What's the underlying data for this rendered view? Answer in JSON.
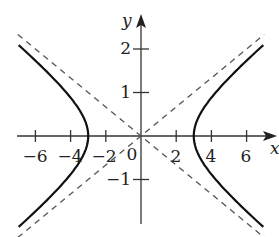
{
  "chart_data": {
    "type": "line",
    "title": "",
    "xlabel": "x",
    "ylabel": "y",
    "xlim": [
      -7.2,
      7.6
    ],
    "ylim": [
      -2.0,
      2.75
    ],
    "grid": false,
    "x_ticks": [
      -6,
      -4,
      -2,
      0,
      2,
      4,
      6
    ],
    "x_tick_labels": [
      "−6",
      "−4",
      "−2",
      "0",
      "2",
      "4",
      "6"
    ],
    "y_ticks": [
      2,
      1,
      -1
    ],
    "y_tick_labels": [
      "2",
      "1",
      "−1"
    ],
    "series": [
      {
        "name": "hyperbola",
        "equation": "x^2/9 - y^2 = 1",
        "style": "solid",
        "vertices": [
          [
            -3,
            0
          ],
          [
            3,
            0
          ]
        ],
        "x_range": [
          -6.9,
          6.9
        ]
      },
      {
        "name": "asymptote",
        "equation": "y = x/3",
        "style": "dashed",
        "x_range": [
          -6.9,
          6.9
        ]
      },
      {
        "name": "asymptote",
        "equation": "y = -x/3",
        "style": "dashed",
        "x_range": [
          -6.9,
          6.9
        ]
      }
    ]
  },
  "labels": {
    "x_axis": "x",
    "y_axis": "y",
    "origin": "0",
    "xt": [
      "−6",
      "−4",
      "−2",
      "2",
      "4",
      "6"
    ],
    "yt": [
      "2",
      "1",
      "−1"
    ]
  }
}
